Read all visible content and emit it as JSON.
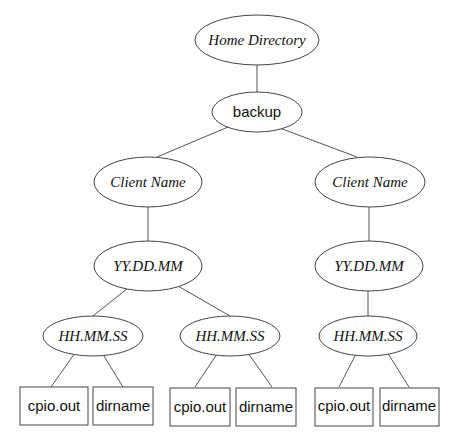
{
  "diagram": {
    "type": "directory-tree",
    "nodes": {
      "root": {
        "label": "Home Directory",
        "style": "italic-serif",
        "shape": "ellipse"
      },
      "backup": {
        "label": "backup",
        "style": "sans",
        "shape": "ellipse"
      },
      "client_left": {
        "label": "Client Name",
        "style": "italic-serif",
        "shape": "ellipse"
      },
      "client_right": {
        "label": "Client Name",
        "style": "italic-serif",
        "shape": "ellipse"
      },
      "date_left": {
        "label": "YY.DD.MM",
        "style": "italic-serif",
        "shape": "ellipse"
      },
      "date_right": {
        "label": "YY.DD.MM",
        "style": "italic-serif",
        "shape": "ellipse"
      },
      "time_1": {
        "label": "HH.MM.SS",
        "style": "italic-serif",
        "shape": "ellipse"
      },
      "time_2": {
        "label": "HH.MM.SS",
        "style": "italic-serif",
        "shape": "ellipse"
      },
      "time_3": {
        "label": "HH.MM.SS",
        "style": "italic-serif",
        "shape": "ellipse"
      },
      "file_1a": {
        "label": "cpio.out",
        "style": "sans",
        "shape": "box"
      },
      "file_1b": {
        "label": "dirname",
        "style": "sans",
        "shape": "box"
      },
      "file_2a": {
        "label": "cpio.out",
        "style": "sans",
        "shape": "box"
      },
      "file_2b": {
        "label": "dirname",
        "style": "sans",
        "shape": "box"
      },
      "file_3a": {
        "label": "cpio.out",
        "style": "sans",
        "shape": "box"
      },
      "file_3b": {
        "label": "dirname",
        "style": "sans",
        "shape": "box"
      }
    },
    "edges": [
      [
        "root",
        "backup"
      ],
      [
        "backup",
        "client_left"
      ],
      [
        "backup",
        "client_right"
      ],
      [
        "client_left",
        "date_left"
      ],
      [
        "client_right",
        "date_right"
      ],
      [
        "date_left",
        "time_1"
      ],
      [
        "date_left",
        "time_2"
      ],
      [
        "date_right",
        "time_3"
      ],
      [
        "time_1",
        "file_1a"
      ],
      [
        "time_1",
        "file_1b"
      ],
      [
        "time_2",
        "file_2a"
      ],
      [
        "time_2",
        "file_2b"
      ],
      [
        "time_3",
        "file_3a"
      ],
      [
        "time_3",
        "file_3b"
      ]
    ]
  }
}
